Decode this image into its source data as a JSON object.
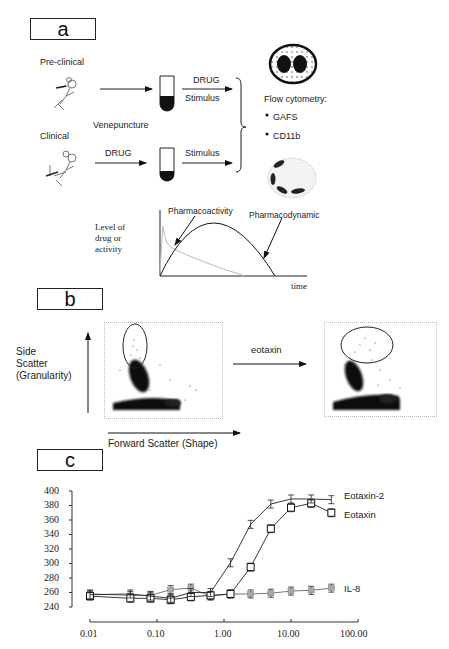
{
  "panels": {
    "a": {
      "label": "a",
      "preclinical_label": "Pre-clinical",
      "clinical_label": "Clinical",
      "venepuncture_label": "Venepuncture",
      "drug_label_top": "DRUG",
      "stimulus_label_top": "Stimulus",
      "drug_label_bottom": "DRUG",
      "stimulus_label_bottom": "Stimulus",
      "flow_title": "Flow cytometry:",
      "flow_items": [
        "GAFS",
        "CD11b"
      ],
      "pk_ylabel_lines": [
        "Level of",
        "drug or",
        "activity"
      ],
      "pk_xlabel": "time",
      "pk_annotations": [
        "Pharmacoactivity",
        "Pharmacodynamic"
      ]
    },
    "b": {
      "label": "b",
      "ylabel_lines": [
        "Side",
        "Scatter",
        "(Granularity)"
      ],
      "xlabel": "Forward Scatter (Shape)",
      "arrow_label": "eotaxin"
    },
    "c": {
      "label": "c"
    }
  },
  "chart_data": {
    "type": "line",
    "title": "",
    "xlabel": "",
    "ylabel": "",
    "xscale": "log",
    "x": [
      0.01,
      0.04,
      0.08,
      0.16,
      0.32,
      0.63,
      1.25,
      2.5,
      5,
      10,
      20,
      40
    ],
    "series": [
      {
        "name": "Eotaxin-2",
        "marker": "bar",
        "values": [
          257,
          258,
          255,
          252,
          260,
          260,
          301,
          354,
          382,
          389,
          389,
          388
        ]
      },
      {
        "name": "Eotaxin",
        "marker": "open-square",
        "values": [
          255,
          252,
          252,
          250,
          254,
          256,
          258,
          295,
          348,
          377,
          383,
          370
        ]
      },
      {
        "name": "IL-8",
        "marker": "grey-square",
        "values": [
          258,
          256,
          256,
          264,
          266,
          255,
          258,
          258,
          259,
          262,
          263,
          266
        ]
      }
    ],
    "yticks": [
      240,
      260,
      280,
      300,
      320,
      340,
      360,
      380,
      400
    ],
    "xticks": [
      "0.01",
      "0.10",
      "1.00",
      "10.00",
      "100.00"
    ],
    "ylim": [
      240,
      400
    ],
    "xlim": [
      0.01,
      100
    ],
    "grid": false,
    "legend_position": "right, inline labels at line ends"
  }
}
